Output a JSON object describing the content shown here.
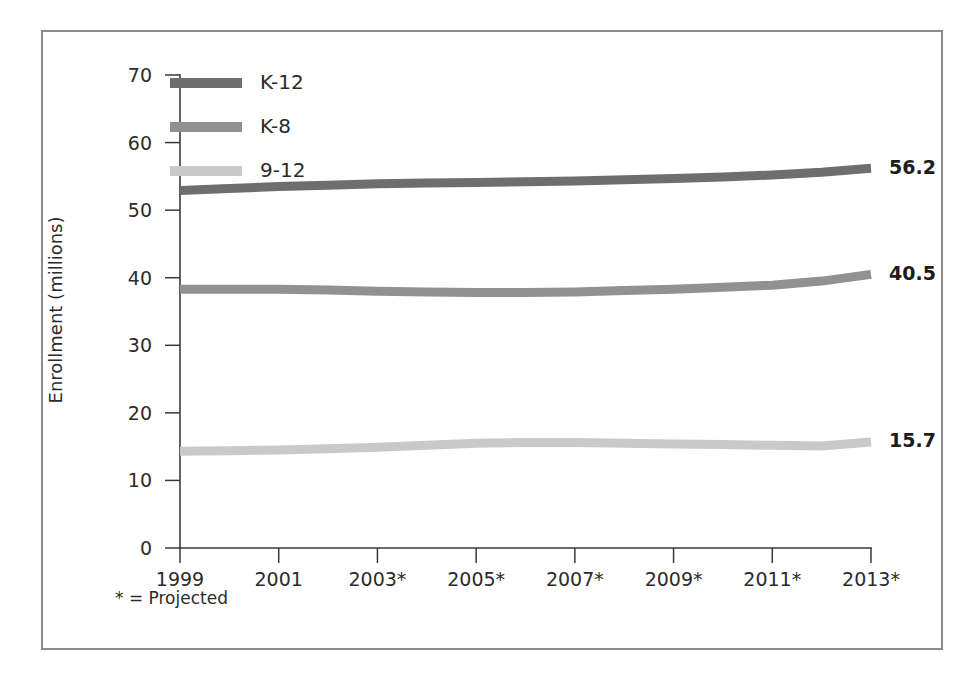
{
  "chart_data": {
    "type": "line",
    "title": "",
    "subtitle": "",
    "xlabel": "",
    "ylabel": "Enrollment (millions)",
    "xlim": [
      1999,
      2013
    ],
    "ylim": [
      0,
      70
    ],
    "grid": false,
    "legend_position": "top-left",
    "x": [
      1999,
      2000,
      2001,
      2002,
      2003,
      2004,
      2005,
      2006,
      2007,
      2008,
      2009,
      2010,
      2011,
      2012,
      2013
    ],
    "x_tick_labels": [
      "1999",
      "2001",
      "2003*",
      "2005*",
      "2007*",
      "2009*",
      "2011*",
      "2013*"
    ],
    "x_tick_values": [
      1999,
      2001,
      2003,
      2005,
      2007,
      2009,
      2011,
      2013
    ],
    "y_tick_labels": [
      "0",
      "10",
      "20",
      "30",
      "40",
      "50",
      "60",
      "70"
    ],
    "y_tick_values": [
      0,
      10,
      20,
      30,
      40,
      50,
      60,
      70
    ],
    "series": [
      {
        "name": "K-12",
        "color": "#6e6e6e",
        "end_label": "56.2",
        "values": [
          52.9,
          53.2,
          53.5,
          53.7,
          53.9,
          54.0,
          54.1,
          54.2,
          54.3,
          54.5,
          54.7,
          54.9,
          55.2,
          55.6,
          56.2
        ]
      },
      {
        "name": "K-8",
        "color": "#919191",
        "end_label": "40.5",
        "values": [
          38.3,
          38.3,
          38.3,
          38.2,
          38.0,
          37.9,
          37.8,
          37.8,
          37.9,
          38.1,
          38.3,
          38.6,
          38.9,
          39.5,
          40.5
        ]
      },
      {
        "name": "9-12",
        "color": "#c9c9c9",
        "end_label": "15.7",
        "values": [
          14.3,
          14.4,
          14.5,
          14.7,
          14.9,
          15.2,
          15.5,
          15.6,
          15.6,
          15.5,
          15.4,
          15.3,
          15.2,
          15.1,
          15.7
        ]
      }
    ],
    "footnote": "* = Projected"
  },
  "legend": {
    "entries": [
      {
        "label": "K-12"
      },
      {
        "label": "K-8"
      },
      {
        "label": "9-12"
      }
    ]
  },
  "axes": {
    "y_title": "Enrollment (millions)"
  },
  "colors": {
    "frame": "#8a8a8a",
    "axis": "#3a3a3a",
    "text": "#2b2b2b",
    "k12": "#6e6e6e",
    "k8": "#919191",
    "g912": "#c9c9c9"
  }
}
